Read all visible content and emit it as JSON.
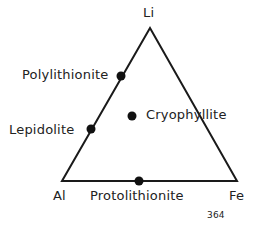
{
  "diagram": {
    "type": "ternary",
    "vertices": {
      "top": "Li",
      "left": "Al",
      "right": "Fe"
    },
    "minerals": [
      {
        "name": "Polylithionite"
      },
      {
        "name": "Lepidolite"
      },
      {
        "name": "Cryophyllite"
      },
      {
        "name": "Protolithionite"
      }
    ],
    "figure_number": "364"
  }
}
